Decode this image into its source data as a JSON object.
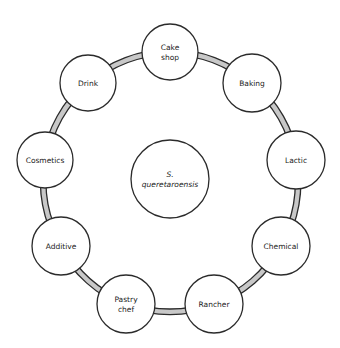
{
  "diagram": {
    "center": {
      "label_lines": [
        "S.",
        "queretaroensis"
      ],
      "cx": 170,
      "cy": 179,
      "r": 39
    },
    "ring": {
      "cx": 170,
      "cy": 181,
      "r": 127
    },
    "nodes": [
      {
        "id": "cake-shop",
        "label_lines": [
          "Cake",
          "shop"
        ],
        "cx": 170,
        "cy": 52,
        "r": 28
      },
      {
        "id": "baking",
        "label_lines": [
          "Baking"
        ],
        "cx": 252,
        "cy": 83,
        "r": 29
      },
      {
        "id": "lactic",
        "label_lines": [
          "Lactic"
        ],
        "cx": 296,
        "cy": 160,
        "r": 29
      },
      {
        "id": "chemical",
        "label_lines": [
          "Chemical"
        ],
        "cx": 281,
        "cy": 246,
        "r": 29
      },
      {
        "id": "rancher",
        "label_lines": [
          "Rancher"
        ],
        "cx": 214,
        "cy": 304,
        "r": 29
      },
      {
        "id": "pastry-chef",
        "label_lines": [
          "Pastry",
          "chef"
        ],
        "cx": 126,
        "cy": 304,
        "r": 29
      },
      {
        "id": "additive",
        "label_lines": [
          "Additive"
        ],
        "cx": 61,
        "cy": 246,
        "r": 29
      },
      {
        "id": "cosmetics",
        "label_lines": [
          "Cosmetics"
        ],
        "cx": 45,
        "cy": 160,
        "r": 28
      },
      {
        "id": "drink",
        "label_lines": [
          "Drink"
        ],
        "cx": 88,
        "cy": 83,
        "r": 28
      }
    ],
    "colors": {
      "stroke": "#2b2b2b",
      "band_fill": "#c8c8c8",
      "node_fill": "#ffffff"
    }
  }
}
